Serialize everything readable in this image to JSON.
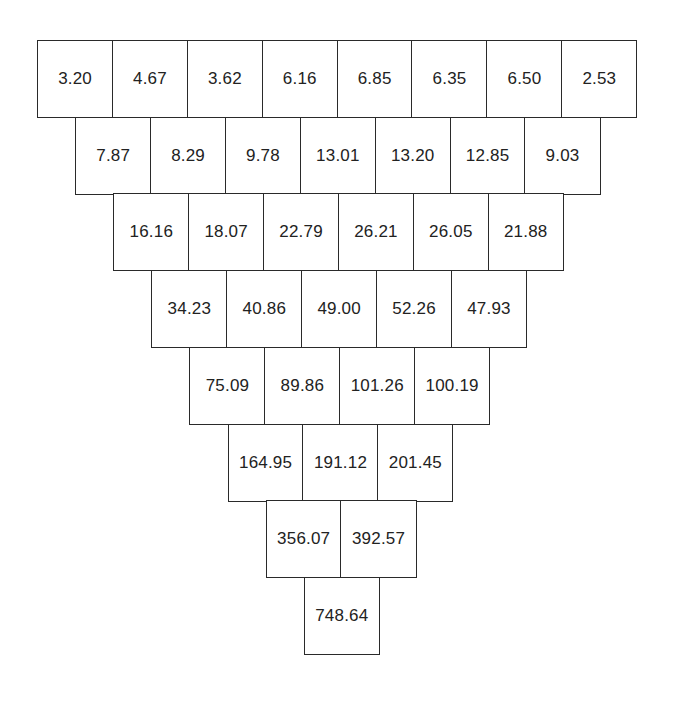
{
  "diagram": {
    "type": "inverted-pyramid",
    "rows": [
      [
        "3.20",
        "4.67",
        "3.62",
        "6.16",
        "6.85",
        "6.35",
        "6.50",
        "2.53"
      ],
      [
        "7.87",
        "8.29",
        "9.78",
        "13.01",
        "13.20",
        "12.85",
        "9.03"
      ],
      [
        "16.16",
        "18.07",
        "22.79",
        "26.21",
        "26.05",
        "21.88"
      ],
      [
        "34.23",
        "40.86",
        "49.00",
        "52.26",
        "47.93"
      ],
      [
        "75.09",
        "89.86",
        "101.26",
        "100.19"
      ],
      [
        "164.95",
        "191.12",
        "201.45"
      ],
      [
        "356.07",
        "392.57"
      ],
      [
        "748.64"
      ]
    ]
  },
  "layout": {
    "origin_x": 37,
    "origin_y": 40,
    "cell_width": 76.2,
    "row_height": 78,
    "row_offset": 38.1
  },
  "colors": {
    "border": "#2a2a2a",
    "text": "#222222",
    "background": "#ffffff"
  }
}
